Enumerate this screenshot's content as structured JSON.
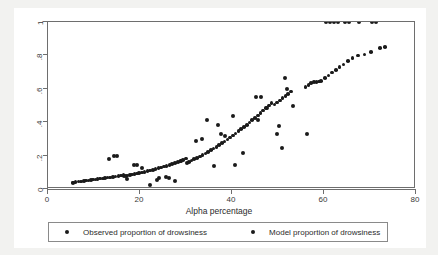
{
  "chart_data": {
    "type": "scatter",
    "title": "",
    "xlabel": "Alpha percentage",
    "ylabel": "",
    "xlim": [
      0,
      80
    ],
    "ylim": [
      0,
      1
    ],
    "xticks": [
      "0",
      "20",
      "40",
      "60",
      "80"
    ],
    "xtick_values": [
      0,
      20,
      40,
      60,
      80
    ],
    "yticks": [
      "0",
      ".2",
      ".4",
      ".6",
      ".8",
      "1"
    ],
    "ytick_values": [
      0,
      0.2,
      0.4,
      0.6,
      0.8,
      1
    ],
    "grid": false,
    "legend_position": "below",
    "series": [
      {
        "name": "Observed proportion of drowsiness",
        "marker": "circle",
        "color": "#1a1a1a",
        "points": [
          [
            5.4,
            0.035
          ],
          [
            5.4,
            0.0
          ],
          [
            7.2,
            0.0
          ],
          [
            8.2,
            0.0
          ],
          [
            9.2,
            0.0
          ],
          [
            10.2,
            0.0
          ],
          [
            11.1,
            0.0
          ],
          [
            13.2,
            0.182
          ],
          [
            14.3,
            0.198
          ],
          [
            15.0,
            0.198
          ],
          [
            16.6,
            0.075
          ],
          [
            17.1,
            0.062
          ],
          [
            18.6,
            0.143
          ],
          [
            19.4,
            0.146
          ],
          [
            20.5,
            0.127
          ],
          [
            22.1,
            0.022
          ],
          [
            23.6,
            0.052
          ],
          [
            24.2,
            0.066
          ],
          [
            25.6,
            0.072
          ],
          [
            26.3,
            0.068
          ],
          [
            27.6,
            0.048
          ],
          [
            29.0,
            0.168
          ],
          [
            30.3,
            0.158
          ],
          [
            32.2,
            0.287
          ],
          [
            33.4,
            0.3
          ],
          [
            34.6,
            0.414
          ],
          [
            36.1,
            0.135
          ],
          [
            36.9,
            0.382
          ],
          [
            37.6,
            0.33
          ],
          [
            38.4,
            0.316
          ],
          [
            40.2,
            0.438
          ],
          [
            40.6,
            0.145
          ],
          [
            42.3,
            0.216
          ],
          [
            45.2,
            0.553
          ],
          [
            46.3,
            0.553
          ],
          [
            45.6,
            0.413
          ],
          [
            47.5,
            0.483
          ],
          [
            49.8,
            0.33
          ],
          [
            50.3,
            0.375
          ],
          [
            50.9,
            0.246
          ],
          [
            51.6,
            0.662
          ],
          [
            52.0,
            0.597
          ],
          [
            53.2,
            0.498
          ],
          [
            56.3,
            0.33
          ],
          [
            59.6,
            0.0
          ],
          [
            60.4,
            1.0
          ],
          [
            61.3,
            1.0
          ],
          [
            62.1,
            1.0
          ],
          [
            63.0,
            1.0
          ],
          [
            64.6,
            1.0
          ],
          [
            65.5,
            1.0
          ],
          [
            67.6,
            1.0
          ],
          [
            70.4,
            1.0
          ],
          [
            71.3,
            1.0
          ]
        ]
      },
      {
        "name": "Model proportion of drowsiness",
        "marker": "circle",
        "color": "#1a1a1a",
        "points": [
          [
            5.4,
            0.04
          ],
          [
            6.0,
            0.042
          ],
          [
            6.6,
            0.044
          ],
          [
            7.2,
            0.046
          ],
          [
            7.8,
            0.048
          ],
          [
            8.3,
            0.05
          ],
          [
            8.8,
            0.052
          ],
          [
            9.3,
            0.054
          ],
          [
            9.8,
            0.056
          ],
          [
            10.3,
            0.058
          ],
          [
            10.8,
            0.06
          ],
          [
            11.3,
            0.062
          ],
          [
            11.9,
            0.064
          ],
          [
            12.4,
            0.066
          ],
          [
            12.9,
            0.068
          ],
          [
            13.5,
            0.07
          ],
          [
            14.1,
            0.073
          ],
          [
            14.7,
            0.076
          ],
          [
            15.3,
            0.079
          ],
          [
            15.9,
            0.082
          ],
          [
            16.4,
            0.085
          ],
          [
            16.9,
            0.078
          ],
          [
            17.3,
            0.08
          ],
          [
            17.8,
            0.083
          ],
          [
            18.3,
            0.086
          ],
          [
            18.8,
            0.089
          ],
          [
            19.3,
            0.092
          ],
          [
            19.8,
            0.095
          ],
          [
            20.4,
            0.099
          ],
          [
            21.0,
            0.103
          ],
          [
            21.6,
            0.107
          ],
          [
            22.2,
            0.111
          ],
          [
            22.8,
            0.115
          ],
          [
            23.4,
            0.119
          ],
          [
            24.0,
            0.124
          ],
          [
            24.6,
            0.129
          ],
          [
            25.2,
            0.134
          ],
          [
            25.8,
            0.139
          ],
          [
            26.4,
            0.144
          ],
          [
            27.0,
            0.15
          ],
          [
            27.6,
            0.156
          ],
          [
            28.2,
            0.162
          ],
          [
            28.8,
            0.168
          ],
          [
            29.4,
            0.175
          ],
          [
            30.0,
            0.182
          ],
          [
            30.6,
            0.162
          ],
          [
            31.2,
            0.17
          ],
          [
            31.8,
            0.178
          ],
          [
            32.4,
            0.186
          ],
          [
            33.0,
            0.195
          ],
          [
            33.6,
            0.204
          ],
          [
            34.2,
            0.213
          ],
          [
            34.8,
            0.222
          ],
          [
            35.4,
            0.232
          ],
          [
            36.0,
            0.242
          ],
          [
            36.6,
            0.252
          ],
          [
            37.2,
            0.263
          ],
          [
            37.8,
            0.274
          ],
          [
            38.4,
            0.285
          ],
          [
            39.0,
            0.297
          ],
          [
            39.6,
            0.309
          ],
          [
            40.2,
            0.321
          ],
          [
            40.8,
            0.333
          ],
          [
            41.4,
            0.346
          ],
          [
            42.0,
            0.359
          ],
          [
            42.6,
            0.372
          ],
          [
            43.2,
            0.385
          ],
          [
            43.8,
            0.398
          ],
          [
            44.4,
            0.412
          ],
          [
            45.0,
            0.426
          ],
          [
            45.6,
            0.44
          ],
          [
            46.2,
            0.455
          ],
          [
            46.8,
            0.47
          ],
          [
            47.4,
            0.485
          ],
          [
            48.0,
            0.5
          ],
          [
            48.6,
            0.515
          ],
          [
            49.2,
            0.505
          ],
          [
            49.8,
            0.518
          ],
          [
            50.4,
            0.531
          ],
          [
            51.0,
            0.544
          ],
          [
            51.6,
            0.557
          ],
          [
            52.2,
            0.57
          ],
          [
            52.8,
            0.583
          ],
          [
            56.0,
            0.61
          ],
          [
            56.6,
            0.622
          ],
          [
            57.2,
            0.633
          ],
          [
            57.8,
            0.64
          ],
          [
            58.4,
            0.641
          ],
          [
            58.9,
            0.643
          ],
          [
            59.4,
            0.645
          ],
          [
            60.2,
            0.663
          ],
          [
            61.0,
            0.68
          ],
          [
            61.8,
            0.697
          ],
          [
            62.6,
            0.714
          ],
          [
            63.4,
            0.73
          ],
          [
            64.2,
            0.746
          ],
          [
            65.2,
            0.766
          ],
          [
            66.2,
            0.785
          ],
          [
            67.4,
            0.8
          ],
          [
            68.8,
            0.805
          ],
          [
            70.2,
            0.822
          ],
          [
            72.2,
            0.846
          ],
          [
            73.2,
            0.852
          ]
        ]
      }
    ]
  },
  "legend": {
    "entries": [
      {
        "label": "Observed proportion of drowsiness"
      },
      {
        "label": "Model proportion of drowsiness"
      }
    ]
  }
}
